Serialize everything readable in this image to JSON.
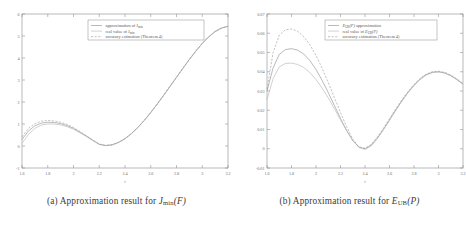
{
  "figure": {
    "panels": [
      {
        "id": "panel-a",
        "caption_prefix": "(a)",
        "caption_text": "Approximation result for",
        "caption_symbol": "J",
        "caption_symbol_sub": "min",
        "caption_symbol_arg": "(F)",
        "legend": {
          "items": [
            {
              "label": "approximation of J",
              "sub": "min",
              "style": "solid-a"
            },
            {
              "label": "real value of J",
              "sub": "min",
              "style": "solid-b"
            },
            {
              "label": "accuracy estimation (Theorem 4)",
              "sub": "",
              "style": "dashed"
            }
          ]
        },
        "chart_data": {
          "type": "line",
          "title": "Approximation result for J_min(F)",
          "xlabel": "r",
          "ylabel": "",
          "xlim": [
            1.6,
            3.2
          ],
          "ylim": [
            -1,
            6
          ],
          "xticks": [
            "1.6",
            "1.8",
            "2",
            "2.2",
            "2.4",
            "2.6",
            "2.8",
            "3",
            "3.2"
          ],
          "xtick_values": [
            1.6,
            1.8,
            2.0,
            2.2,
            2.4,
            2.6,
            2.8,
            3.0,
            3.2
          ],
          "yticks": [
            "-1",
            "0",
            "1",
            "2",
            "3",
            "4",
            "5",
            "6"
          ],
          "ytick_values": [
            -1,
            0,
            1,
            2,
            3,
            4,
            5,
            6
          ],
          "grid": false,
          "legend_position": "upper-center",
          "x": [
            1.6,
            1.65,
            1.7,
            1.75,
            1.8,
            1.85,
            1.9,
            1.95,
            2.0,
            2.05,
            2.1,
            2.15,
            2.2,
            2.25,
            2.3,
            2.35,
            2.4,
            2.45,
            2.5,
            2.55,
            2.6,
            2.65,
            2.7,
            2.75,
            2.8,
            2.85,
            2.9,
            2.95,
            3.0,
            3.05,
            3.1,
            3.15,
            3.2
          ],
          "series": [
            {
              "name": "approximation of J_min",
              "style": "solid-a",
              "values": [
                0.3,
                0.68,
                0.92,
                1.04,
                1.08,
                1.07,
                1.02,
                0.93,
                0.8,
                0.63,
                0.45,
                0.26,
                0.08,
                0.02,
                0.05,
                0.16,
                0.33,
                0.56,
                0.84,
                1.16,
                1.52,
                1.9,
                2.3,
                2.71,
                3.12,
                3.53,
                3.93,
                4.31,
                4.66,
                4.96,
                5.2,
                5.36,
                5.44
              ]
            },
            {
              "name": "real value of J_min",
              "style": "solid-b",
              "values": [
                0.12,
                0.52,
                0.8,
                0.95,
                1.0,
                1.0,
                0.96,
                0.88,
                0.76,
                0.6,
                0.43,
                0.25,
                0.07,
                0.01,
                0.05,
                0.16,
                0.33,
                0.56,
                0.84,
                1.16,
                1.52,
                1.9,
                2.3,
                2.71,
                3.12,
                3.53,
                3.93,
                4.31,
                4.66,
                4.96,
                5.2,
                5.36,
                5.44
              ]
            },
            {
              "name": "accuracy estimation (Theorem 4)",
              "style": "dashed",
              "values": [
                0.42,
                0.8,
                1.02,
                1.13,
                1.16,
                1.14,
                1.08,
                0.98,
                0.84,
                0.66,
                0.47,
                0.27,
                0.09,
                0.03,
                0.06,
                0.17,
                0.34,
                0.57,
                0.85,
                1.17,
                1.53,
                1.91,
                2.31,
                2.72,
                3.13,
                3.54,
                3.94,
                4.32,
                4.67,
                4.97,
                5.21,
                5.37,
                5.45
              ]
            }
          ]
        }
      },
      {
        "id": "panel-b",
        "caption_prefix": "(b)",
        "caption_text": "Approximation result for",
        "caption_symbol": "E",
        "caption_symbol_sub": "UB",
        "caption_symbol_arg": "(P)",
        "legend": {
          "items": [
            {
              "label": "approximation",
              "prefix_symbol": "E",
              "prefix_sub": "UB",
              "prefix_arg": "(P)",
              "style": "solid-a"
            },
            {
              "label": "real value of",
              "suffix_symbol": "E",
              "suffix_sub": "UB",
              "suffix_arg": "(P)",
              "style": "solid-b"
            },
            {
              "label": "accuracy estimation (Theorem 4)",
              "style": "dashed"
            }
          ]
        },
        "chart_data": {
          "type": "line",
          "title": "Approximation result for E_UB(P)",
          "xlabel": "r",
          "ylabel": "",
          "xlim": [
            1.6,
            3.2
          ],
          "ylim": [
            -0.01,
            0.07
          ],
          "xticks": [
            "1.6",
            "1.8",
            "2",
            "2.2",
            "2.4",
            "2.6",
            "2.8",
            "3",
            "3.2"
          ],
          "xtick_values": [
            1.6,
            1.8,
            2.0,
            2.2,
            2.4,
            2.6,
            2.8,
            3.0,
            3.2
          ],
          "yticks": [
            "-0.01",
            "0",
            "0.01",
            "0.02",
            "0.03",
            "0.04",
            "0.05",
            "0.06",
            "0.07"
          ],
          "ytick_values": [
            -0.01,
            0,
            0.01,
            0.02,
            0.03,
            0.04,
            0.05,
            0.06,
            0.07
          ],
          "grid": false,
          "legend_position": "upper-center",
          "x": [
            1.6,
            1.65,
            1.7,
            1.75,
            1.8,
            1.85,
            1.9,
            1.95,
            2.0,
            2.05,
            2.1,
            2.15,
            2.2,
            2.25,
            2.3,
            2.35,
            2.4,
            2.45,
            2.5,
            2.55,
            2.6,
            2.65,
            2.7,
            2.75,
            2.8,
            2.85,
            2.9,
            2.95,
            3.0,
            3.05,
            3.1,
            3.15,
            3.2
          ],
          "series": [
            {
              "name": "E_UB(P) approximation",
              "style": "solid-a",
              "values": [
                0.03,
                0.042,
                0.049,
                0.0515,
                0.052,
                0.0512,
                0.0492,
                0.0458,
                0.0412,
                0.0355,
                0.0292,
                0.0225,
                0.0158,
                0.0095,
                0.0042,
                0.0008,
                0.0,
                0.0018,
                0.0055,
                0.01,
                0.015,
                0.02,
                0.0248,
                0.0292,
                0.033,
                0.0362,
                0.0385,
                0.0397,
                0.04,
                0.0394,
                0.038,
                0.036,
                0.0336
              ]
            },
            {
              "name": "real value of E_UB(P)",
              "style": "solid-b",
              "values": [
                0.0255,
                0.0365,
                0.0425,
                0.0443,
                0.0445,
                0.0438,
                0.0422,
                0.0396,
                0.036,
                0.0315,
                0.0264,
                0.0208,
                0.015,
                0.0094,
                0.0044,
                0.0008,
                -0.0004,
                0.0014,
                0.0052,
                0.0098,
                0.0148,
                0.0198,
                0.0246,
                0.029,
                0.0328,
                0.036,
                0.0383,
                0.0396,
                0.0399,
                0.0393,
                0.0379,
                0.0359,
                0.0335
              ]
            },
            {
              "name": "accuracy estimation (Theorem 4)",
              "style": "dashed",
              "values": [
                0.031,
                0.05,
                0.059,
                0.0618,
                0.0622,
                0.061,
                0.0582,
                0.054,
                0.0485,
                0.0418,
                0.0344,
                0.0266,
                0.0188,
                0.0114,
                0.005,
                0.001,
                0.0002,
                0.0022,
                0.006,
                0.0106,
                0.0156,
                0.0206,
                0.0253,
                0.0296,
                0.0334,
                0.0365,
                0.0388,
                0.04,
                0.0403,
                0.0397,
                0.0383,
                0.0363,
                0.0339
              ]
            }
          ]
        }
      }
    ]
  }
}
